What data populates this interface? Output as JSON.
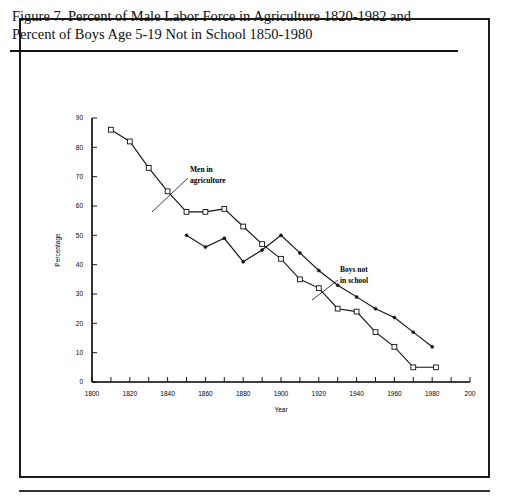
{
  "figure": {
    "title_line_1": "Figure 7. Percent of Male Labor Force in Agriculture 1820-1982 and",
    "title_line_2": "Percent of Boys Age 5-19 Not in School 1850-1980"
  },
  "chart_data": {
    "type": "line",
    "title": "",
    "xlabel": "Year",
    "ylabel": "Percentage",
    "xlim": [
      1800,
      2000
    ],
    "ylim": [
      0,
      90
    ],
    "xticks": [
      1800,
      1820,
      1840,
      1860,
      1880,
      1900,
      1920,
      1940,
      1960,
      1980,
      2000
    ],
    "xtick_labels": [
      "1800",
      "1820",
      "1840",
      "1860",
      "1880",
      "1900",
      "1920",
      "1940",
      "1960",
      "1980",
      "200"
    ],
    "yticks": [
      0,
      10,
      20,
      30,
      40,
      50,
      60,
      70,
      80,
      90
    ],
    "ytick_labels": [
      "0",
      "10",
      "20",
      "30",
      "40",
      "50",
      "60",
      "70",
      "80",
      "90"
    ],
    "grid": false,
    "legend_position": "inline-annotations",
    "series": [
      {
        "name": "Men in agriculture",
        "marker": "open-square",
        "x": [
          1810,
          1820,
          1830,
          1840,
          1850,
          1860,
          1870,
          1880,
          1890,
          1900,
          1910,
          1920,
          1930,
          1940,
          1950,
          1960,
          1970,
          1982
        ],
        "values": [
          86,
          82,
          73,
          65,
          58,
          58,
          59,
          53,
          47,
          42,
          35,
          32,
          25,
          24,
          17,
          12,
          5,
          5
        ]
      },
      {
        "name": "Boys not in school",
        "marker": "dot",
        "x": [
          1850,
          1860,
          1870,
          1880,
          1890,
          1900,
          1910,
          1920,
          1930,
          1940,
          1950,
          1960,
          1970,
          1980
        ],
        "values": [
          50,
          46,
          49,
          41,
          45,
          50,
          44,
          38,
          33,
          29,
          25,
          22,
          17,
          12
        ]
      }
    ],
    "annotations": [
      {
        "text_line_1": "Men in",
        "text_line_2": "agriculture"
      },
      {
        "text_line_1": "Boys not",
        "text_line_2": "in school"
      }
    ]
  }
}
